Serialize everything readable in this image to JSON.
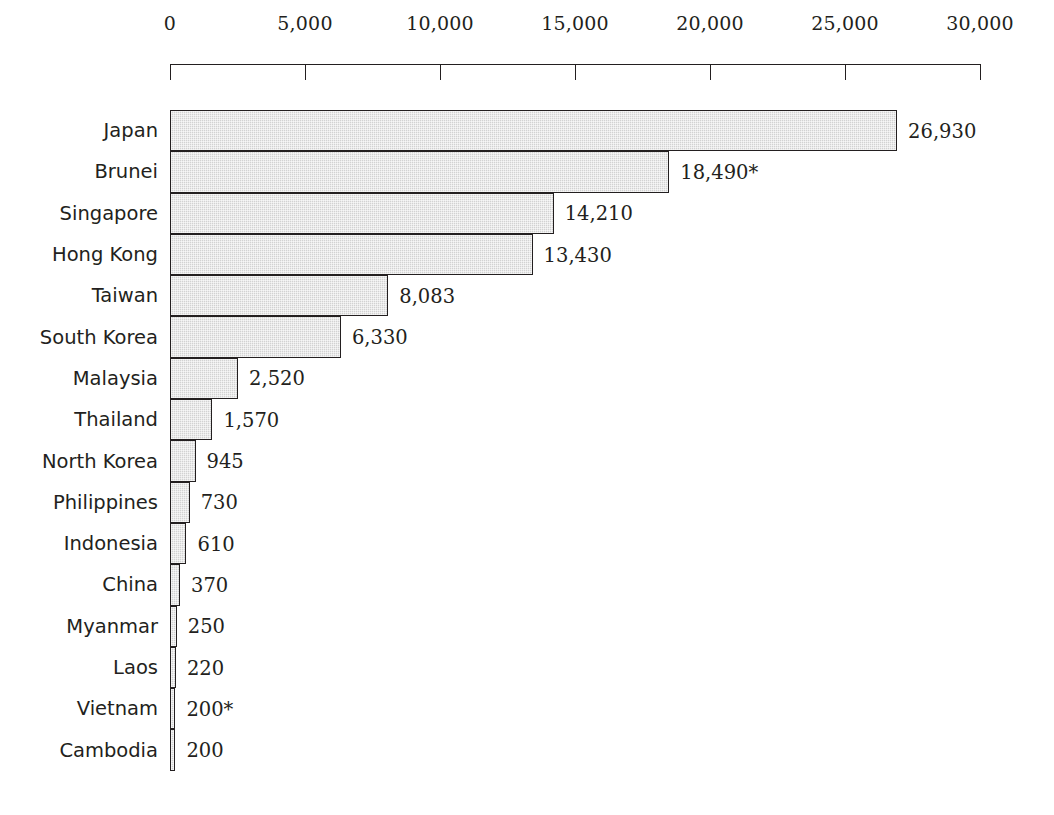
{
  "chart_data": {
    "type": "bar",
    "orientation": "horizontal",
    "title": "",
    "subtitle": "",
    "xlabel": "",
    "ylabel": "",
    "xlim": [
      0,
      30000
    ],
    "grid": false,
    "legend": null,
    "tick_labels": [
      "0",
      "5,000",
      "10,000",
      "15,000",
      "20,000",
      "25,000",
      "30,000"
    ],
    "ticks": [
      0,
      5000,
      10000,
      15000,
      20000,
      25000,
      30000
    ],
    "categories": [
      "Japan",
      "Brunei",
      "Singapore",
      "Hong Kong",
      "Taiwan",
      "South Korea",
      "Malaysia",
      "Thailand",
      "North Korea",
      "Philippines",
      "Indonesia",
      "China",
      "Myanmar",
      "Laos",
      "Vietnam",
      "Cambodia"
    ],
    "values": [
      26930,
      18490,
      14210,
      13430,
      8083,
      6330,
      2520,
      1570,
      945,
      730,
      610,
      370,
      250,
      220,
      200,
      200
    ],
    "value_labels": [
      "26,930",
      "18,490*",
      "14,210",
      "13,430",
      "8,083",
      "6,330",
      "2,520",
      "1,570",
      "945",
      "730",
      "610",
      "370",
      "250",
      "220",
      "200*",
      "200"
    ],
    "colors": {
      "bar_fill": "#d2d2d2",
      "bar_border": "#231f20",
      "text": "#231f20",
      "background": "#ffffff"
    }
  }
}
